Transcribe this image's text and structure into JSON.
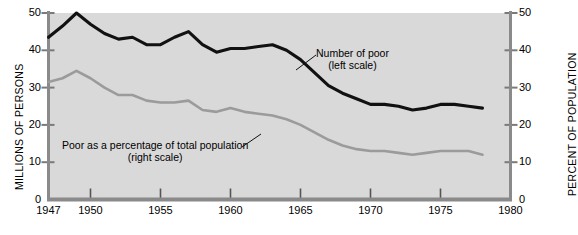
{
  "chart_data": {
    "type": "line",
    "title": "",
    "xlabel": "",
    "ylabel": "MILLIONS OF PERSONS",
    "ylabel_right": "PERCENT OF POPULATION",
    "xlim": [
      1947,
      1980
    ],
    "ylim": [
      0,
      50
    ],
    "ylim_right": [
      0,
      50
    ],
    "grid": false,
    "legend_position": "inline-annotations",
    "xticks": [
      1947,
      1950,
      1955,
      1960,
      1965,
      1970,
      1975,
      1980
    ],
    "xtick_labels": [
      "1947",
      "1950",
      "1955",
      "1960",
      "1965",
      "1970",
      "1975",
      "1980"
    ],
    "yticks": [
      0,
      10,
      20,
      30,
      40,
      50
    ],
    "ytick_labels": [
      "0",
      "10",
      "20",
      "30",
      "40",
      "50"
    ],
    "yticks_right": [
      0,
      10,
      20,
      30,
      40,
      50
    ],
    "ytick_labels_right": [
      "0",
      "10",
      "20",
      "30",
      "40",
      "50"
    ],
    "series": [
      {
        "name": "Number of poor",
        "axis": "left",
        "units": "millions of persons",
        "color": "#111111",
        "annotation": "Number of poor",
        "annotation_sub": "(left scale)",
        "x": [
          1947,
          1948,
          1949,
          1950,
          1951,
          1952,
          1953,
          1954,
          1955,
          1956,
          1957,
          1958,
          1959,
          1960,
          1961,
          1962,
          1963,
          1964,
          1965,
          1966,
          1967,
          1968,
          1969,
          1970,
          1971,
          1972,
          1973,
          1974,
          1975,
          1976,
          1977,
          1978
        ],
        "values": [
          43.5,
          46.5,
          50.0,
          47.0,
          44.5,
          43.0,
          43.5,
          41.5,
          41.5,
          43.5,
          45.0,
          41.5,
          39.5,
          40.5,
          40.5,
          41.0,
          41.5,
          40.0,
          37.5,
          34.0,
          30.5,
          28.5,
          27.0,
          25.5,
          25.5,
          25.0,
          24.0,
          24.5,
          25.5,
          25.5,
          25.0,
          24.5
        ]
      },
      {
        "name": "Poor as a percentage of total population",
        "axis": "right",
        "units": "percent of population",
        "color": "#9b9b9b",
        "annotation": "Poor as a percentage of total population",
        "annotation_sub": "(right scale)",
        "x": [
          1947,
          1948,
          1949,
          1950,
          1951,
          1952,
          1953,
          1954,
          1955,
          1956,
          1957,
          1958,
          1959,
          1960,
          1961,
          1962,
          1963,
          1964,
          1965,
          1966,
          1967,
          1968,
          1969,
          1970,
          1971,
          1972,
          1973,
          1974,
          1975,
          1976,
          1977,
          1978
        ],
        "values": [
          31.5,
          32.5,
          34.5,
          32.5,
          30.0,
          28.0,
          28.0,
          26.5,
          26.0,
          26.0,
          26.5,
          24.0,
          23.5,
          24.5,
          23.5,
          23.0,
          22.5,
          21.5,
          20.0,
          18.0,
          16.0,
          14.5,
          13.5,
          13.0,
          13.0,
          12.5,
          12.0,
          12.5,
          13.0,
          13.0,
          13.0,
          12.0
        ]
      }
    ]
  },
  "style": {
    "plot_background": "#d9d9d9",
    "axis_color": "#7a7a7a",
    "page_background": "#ffffff"
  }
}
